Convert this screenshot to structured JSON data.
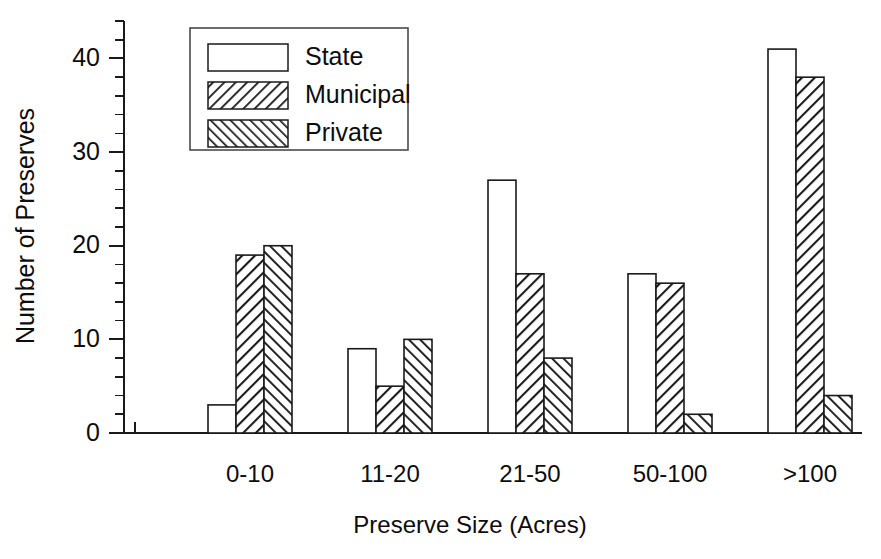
{
  "chart_data": {
    "type": "bar",
    "title": "",
    "xlabel": "Preserve Size  (Acres)",
    "ylabel": "Number of Preserves",
    "categories": [
      "0-10",
      "11-20",
      "21-50",
      "50-100",
      ">100"
    ],
    "series": [
      {
        "name": "State",
        "values": [
          3,
          9,
          27,
          17,
          41
        ],
        "fill": "none",
        "color": "#ffffff"
      },
      {
        "name": "Municipal",
        "values": [
          19,
          5,
          17,
          16,
          38
        ],
        "fill": "diagonal-forward",
        "color": "#ffffff"
      },
      {
        "name": "Private",
        "values": [
          20,
          10,
          8,
          2,
          4
        ],
        "fill": "diagonal-backward",
        "color": "#ffffff"
      }
    ],
    "ylim": [
      0,
      44
    ],
    "ytick_labels": [
      "0",
      "10",
      "20",
      "30",
      "40"
    ],
    "ytick_values": [
      0,
      10,
      20,
      30,
      40
    ],
    "yminor_step": 2,
    "grid": false,
    "legend_position": "top-center",
    "axis_color": "#1a1a1a",
    "background": "#ffffff"
  },
  "legend": {
    "entries": [
      {
        "label": "State"
      },
      {
        "label": "Municipal"
      },
      {
        "label": "Private"
      }
    ]
  }
}
